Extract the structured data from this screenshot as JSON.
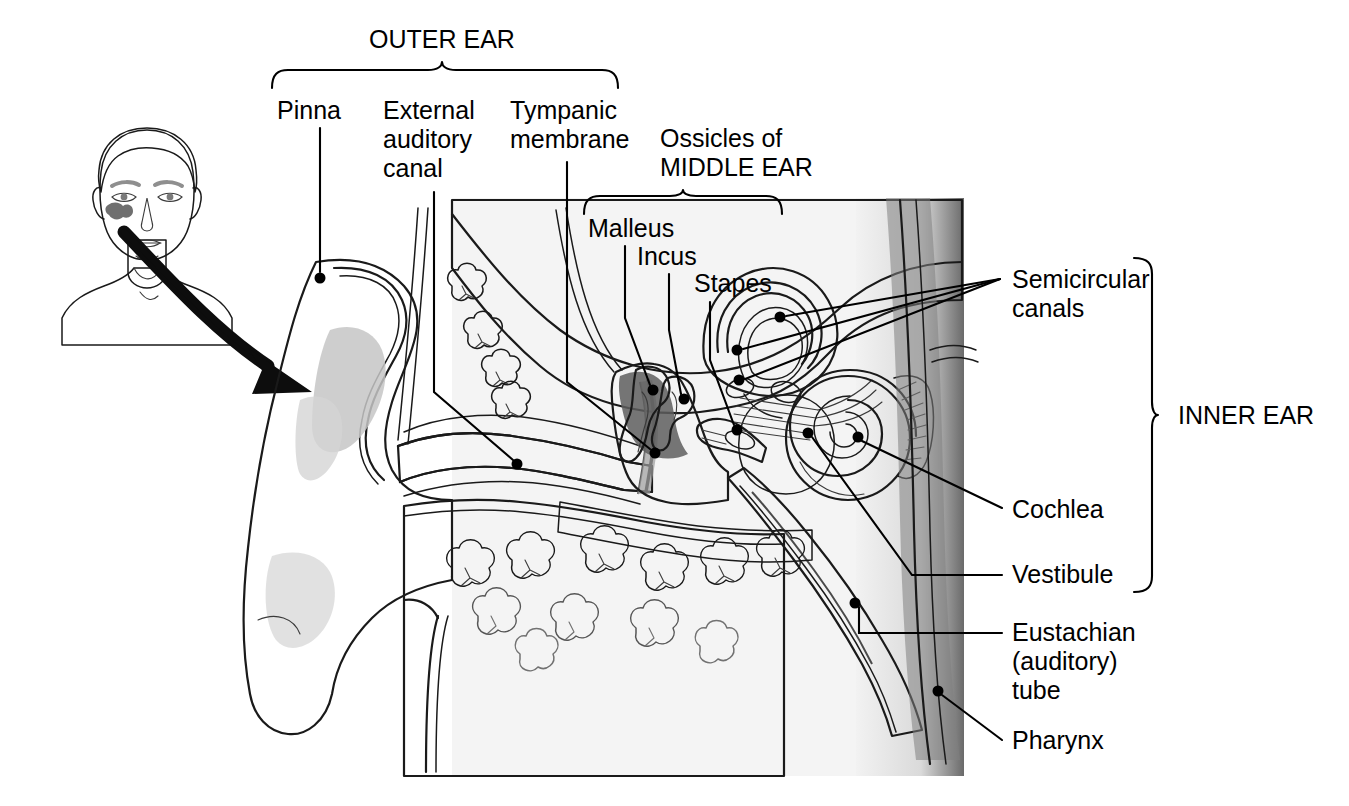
{
  "figure": {
    "type": "labeled anatomical cross-section diagram",
    "background_color": "#ffffff",
    "ink_color": "#000000"
  },
  "group_braces": [
    {
      "id": "outer-ear",
      "label": "OUTER EAR",
      "orientation": "horizontal-down",
      "label_x": 442,
      "label_y": 48,
      "span_start": 272,
      "span_end": 618,
      "apex": 442,
      "base_y": 88,
      "apex_y": 62
    },
    {
      "id": "middle-ear",
      "label": "MIDDLE EAR",
      "label_full": "Ossicles of MIDDLE EAR",
      "orientation": "horizontal-down",
      "label_x": 683,
      "label_y": 176,
      "span_start": 584,
      "span_end": 782,
      "apex": 683,
      "base_y": 214,
      "apex_y": 190
    },
    {
      "id": "inner-ear",
      "label": "INNER EAR",
      "orientation": "vertical-right",
      "label_x": 1178,
      "label_y": 424,
      "span_start": 258,
      "span_end": 592,
      "apex": 415,
      "base_x": 1134,
      "apex_x": 1160
    }
  ],
  "header_labels": [
    {
      "id": "ossicles-of",
      "lines": [
        "Ossicles of"
      ],
      "x": 660,
      "y": 147
    }
  ],
  "callouts": [
    {
      "id": "pinna",
      "lines": [
        "Pinna"
      ],
      "text_x": 277,
      "text_y": 119,
      "anchor": "start",
      "dot_x": 320,
      "dot_y": 278,
      "leader": "M 320,128 L 320,272",
      "region": "outer ear"
    },
    {
      "id": "external-auditory-canal",
      "lines": [
        "External",
        "auditory",
        "canal"
      ],
      "text_x": 383,
      "text_y": 119,
      "anchor": "start",
      "dot_x": 517,
      "dot_y": 464,
      "leader": "M 434,192 L 434,392 L 513,460",
      "region": "outer ear"
    },
    {
      "id": "tympanic-membrane",
      "lines": [
        "Tympanic",
        "membrane"
      ],
      "text_x": 510,
      "text_y": 119,
      "anchor": "start",
      "dot_x": 655,
      "dot_y": 453,
      "leader": "M 567,162 L 567,382 L 650,449",
      "region": "outer ear"
    },
    {
      "id": "malleus",
      "lines": [
        "Malleus"
      ],
      "text_x": 588,
      "text_y": 237,
      "anchor": "start",
      "dot_x": 653,
      "dot_y": 390,
      "leader": "M 625,246 L 625,318 L 650,385",
      "region": "middle ear ossicle"
    },
    {
      "id": "incus",
      "lines": [
        "Incus"
      ],
      "text_x": 637,
      "text_y": 265,
      "anchor": "start",
      "dot_x": 684,
      "dot_y": 399,
      "leader": "M 669,274 L 669,330 L 681,394",
      "region": "middle ear ossicle"
    },
    {
      "id": "stapes",
      "lines": [
        "Stapes"
      ],
      "text_x": 694,
      "text_y": 292,
      "anchor": "start",
      "dot_x": 737,
      "dot_y": 430,
      "leader": "M 710,302 L 710,360 L 734,425",
      "region": "middle ear ossicle"
    },
    {
      "id": "semicircular-canals",
      "lines": [
        "Semicircular",
        "canals"
      ],
      "text_x": 1012,
      "text_y": 288,
      "anchor": "start",
      "converge_x": 1000,
      "converge_y": 279,
      "dots": [
        {
          "x": 780,
          "y": 317
        },
        {
          "x": 737,
          "y": 350
        },
        {
          "x": 739,
          "y": 380
        }
      ],
      "region": "inner ear"
    },
    {
      "id": "cochlea",
      "lines": [
        "Cochlea"
      ],
      "text_x": 1012,
      "text_y": 518,
      "anchor": "start",
      "dot_x": 858,
      "dot_y": 437,
      "leader": "M 1002,508 L 862,441",
      "region": "inner ear"
    },
    {
      "id": "vestibule",
      "lines": [
        "Vestibule"
      ],
      "text_x": 1012,
      "text_y": 583,
      "anchor": "start",
      "dot_x": 808,
      "dot_y": 433,
      "leader": "M 1002,575 L 912,575 L 812,437",
      "region": "inner ear"
    },
    {
      "id": "eustachian-auditory-tube",
      "lines": [
        "Eustachian",
        "(auditory)",
        "tube"
      ],
      "text_x": 1012,
      "text_y": 641,
      "anchor": "start",
      "dot_x": 855,
      "dot_y": 603,
      "leader": "M 1002,633 L 859,633 L 859,607",
      "region": "middle ear"
    },
    {
      "id": "pharynx",
      "lines": [
        "Pharynx"
      ],
      "text_x": 1012,
      "text_y": 749,
      "anchor": "start",
      "dot_x": 938,
      "dot_y": 691,
      "leader": "M 1002,740 L 942,695",
      "region": "pharynx"
    }
  ],
  "inset": {
    "id": "head-inset",
    "description": "grayscale line drawing of a man's head and shoulders, front view, with the ear region highlighted",
    "x": 58,
    "y": 122,
    "width": 180,
    "height": 220
  },
  "pointer_arrow": {
    "id": "magnification-arrow",
    "description": "thick curved black arrow from the ear on the head inset to the enlarged ear diagram",
    "from_x": 124,
    "from_y": 232,
    "to_x": 300,
    "to_y": 386
  },
  "palette": {
    "paper": "#ffffff",
    "tissue_light": "#e3e3e3",
    "tissue_mid": "#cfcfcf",
    "tissue_dark": "#a8a8a8",
    "cavity_dark": "#8a8a8a",
    "bone_stipple": "#bdbdbd",
    "outline": "#1a1a1a"
  }
}
